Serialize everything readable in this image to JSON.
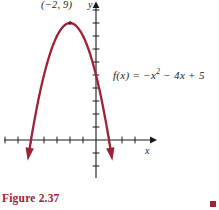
{
  "figure": {
    "caption": "Figure 2.37",
    "accent_color": "#9d2235",
    "axis_color": "#1a1a1a",
    "curve_color": "#9d2235",
    "background": "#ffffff"
  },
  "labels": {
    "vertex": "(−2, 9)",
    "axis_x": "x",
    "axis_y": "y",
    "function_prefix": "f(x)  =  −x",
    "function_exponent": "2",
    "function_suffix": " − 4x + 5",
    "function_full": "f(x) = −x² − 4x + 5"
  },
  "chart_data": {
    "type": "line",
    "title": "",
    "xlabel": "x",
    "ylabel": "y",
    "equation": "f(x) = -x^2 - 4x + 5",
    "curve_label": "f(x) = −x² − 4x + 5",
    "vertex": {
      "x": -2,
      "y": 9,
      "label": "(−2, 9)",
      "marked": true
    },
    "roots": [
      -5,
      1
    ],
    "y_intercept": 5,
    "opens": "down",
    "grid": false,
    "legend": "none",
    "xlim": [
      -7.4,
      4.3
    ],
    "ylim": [
      -2.5,
      10.7
    ],
    "x_ticks": [
      -7,
      -6,
      -5,
      -4,
      -3,
      -2,
      -1,
      1,
      2,
      3,
      4
    ],
    "y_ticks": [
      -2,
      -1,
      1,
      2,
      3,
      4,
      5,
      6,
      7,
      8,
      9,
      10
    ],
    "x": [
      -7.0,
      -6.5,
      -6.0,
      -5.5,
      -5.0,
      -4.5,
      -4.0,
      -3.5,
      -3.0,
      -2.5,
      -2.0,
      -1.5,
      -1.0,
      -0.5,
      0.0,
      0.5,
      1.0,
      1.5,
      2.0,
      2.5,
      3.0
    ],
    "values": [
      -16.0,
      -11.25,
      -7.0,
      -3.25,
      0.0,
      2.75,
      5.0,
      6.75,
      8.0,
      8.75,
      9.0,
      8.75,
      8.0,
      6.75,
      5.0,
      2.75,
      0.0,
      -3.25,
      -7.0,
      -11.25,
      -16.0
    ],
    "arrow_ends": [
      "both"
    ],
    "axis_arrows": {
      "x": "right",
      "y": "up"
    }
  }
}
